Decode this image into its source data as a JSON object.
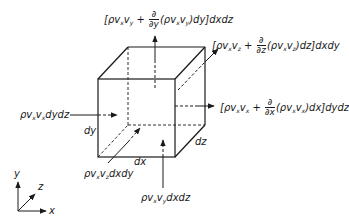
{
  "diagram": {
    "labels": {
      "top_flux": {
        "pre": "[ρv",
        "s1": "x",
        "mid": "v",
        "s2": "y",
        "plus": " + ",
        "frac_num": "∂",
        "frac_den": "∂y",
        "post_a": "(ρv",
        "s3": "x",
        "post_b": "v",
        "s4": "y",
        "post_c": ")dy]dxdz"
      },
      "back_flux": {
        "pre": "[ρv",
        "s1": "x",
        "mid": "v",
        "s2": "z",
        "plus": " + ",
        "frac_num": "∂",
        "frac_den": "∂z",
        "post_a": "(ρv",
        "s3": "x",
        "post_b": "v",
        "s4": "z",
        "post_c": ")dz]dxdy"
      },
      "right_flux": {
        "pre": "[ρv",
        "s1": "x",
        "mid": "v",
        "s2": "x",
        "plus": " + ",
        "frac_num": "∂",
        "frac_den": "∂x",
        "post_a": "(ρv",
        "s3": "x",
        "post_b": "v",
        "s4": "x",
        "post_c": ")dx]dydz"
      },
      "left_flux": {
        "pre": "ρv",
        "s1": "x",
        "mid": "v",
        "s2": "x",
        "post": "dydz"
      },
      "front_flux": {
        "pre": "ρv",
        "s1": "x",
        "mid": "v",
        "s2": "z",
        "post": "dxdy"
      },
      "bottom_flux": {
        "pre": "ρv",
        "s1": "x",
        "mid": "v",
        "s2": "y",
        "post": "dxdz"
      },
      "dims": {
        "dx": "dx",
        "dy": "dy",
        "dz": "dz"
      },
      "axes": {
        "x": "x",
        "y": "y",
        "z": "z"
      }
    },
    "colors": {
      "stroke": "#1a1a1a",
      "background": "#ffffff"
    }
  }
}
